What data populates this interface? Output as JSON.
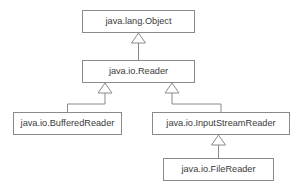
{
  "diagram": {
    "type": "uml-class-diagram",
    "relationship_kind": "generalization",
    "background_color": "#ffffff",
    "border_color": "#8a8a8a",
    "text_color": "#3a3a3a",
    "classes": [
      {
        "id": "object",
        "label": "java.lang.Object",
        "x": 82,
        "y": 10,
        "width": 113,
        "height": 23,
        "center_x": 138.5,
        "center_y": 21.5
      },
      {
        "id": "reader",
        "label": "java.io.Reader",
        "x": 82,
        "y": 60,
        "width": 113,
        "height": 23,
        "center_x": 138.5,
        "center_y": 71.5
      },
      {
        "id": "buffered-reader",
        "label": "java.io.BufferedReader",
        "x": 13,
        "y": 112,
        "width": 109,
        "height": 23,
        "center_x": 67.5,
        "center_y": 123.5
      },
      {
        "id": "input-stream-reader",
        "label": "java.io.InputStreamReader",
        "x": 152,
        "y": 112,
        "width": 138,
        "height": 23,
        "center_x": 221,
        "center_y": 123.5
      },
      {
        "id": "file-reader",
        "label": "java.io.FileReader",
        "x": 163,
        "y": 158,
        "width": 111,
        "height": 23,
        "center_x": 218.5,
        "center_y": 169.5
      }
    ],
    "generalizations": [
      {
        "id": "reader-to-object",
        "subclass": "java.io.Reader",
        "superclass": "java.lang.Object",
        "arrow_x": 138.5,
        "arrow_tip_y": 33,
        "arrow_base_y": 43,
        "line_from_y": 60,
        "path_kind": "straight"
      },
      {
        "id": "bufferedreader-to-reader",
        "subclass": "java.io.BufferedReader",
        "superclass": "java.io.Reader",
        "arrow_x": 105,
        "arrow_tip_y": 83,
        "arrow_base_y": 93,
        "line_from_y": 112,
        "elbow_x": 67.5,
        "elbow_y": 104,
        "path_kind": "elbow"
      },
      {
        "id": "inputstreamreader-to-reader",
        "subclass": "java.io.InputStreamReader",
        "superclass": "java.io.Reader",
        "arrow_x": 172,
        "arrow_tip_y": 83,
        "arrow_base_y": 93,
        "line_from_y": 112,
        "elbow_x": 221,
        "elbow_y": 104,
        "path_kind": "elbow"
      },
      {
        "id": "filereader-to-inputstreamreader",
        "subclass": "java.io.FileReader",
        "superclass": "java.io.InputStreamReader",
        "arrow_x": 218.5,
        "arrow_tip_y": 135,
        "arrow_base_y": 145,
        "line_from_y": 158,
        "path_kind": "straight"
      }
    ],
    "arrowhead": {
      "shape": "hollow-triangle",
      "width": 14,
      "height": 10
    }
  }
}
